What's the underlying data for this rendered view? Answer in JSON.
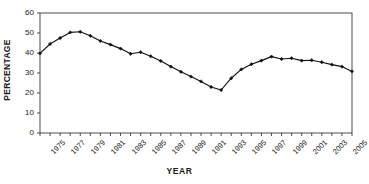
{
  "chart_data": {
    "type": "line",
    "title": "",
    "xlabel": "YEAR",
    "ylabel": "PERCENTAGE",
    "xlim": [
      1975,
      2006
    ],
    "ylim": [
      0,
      60
    ],
    "ytick_values": [
      0,
      10,
      20,
      30,
      40,
      50,
      60
    ],
    "ytick_labels": [
      "0",
      "10",
      "20",
      "30",
      "40",
      "50",
      "60"
    ],
    "xtick_labels": [
      "1975",
      "1977",
      "1979",
      "1981",
      "1983",
      "1985",
      "1987",
      "1989",
      "1991",
      "1993",
      "1995",
      "1997",
      "1999",
      "2001",
      "2003",
      "2005"
    ],
    "grid": false,
    "legend": false,
    "line_color": "#111111",
    "marker": "diamond",
    "marker_color": "#111111",
    "x": [
      1975,
      1976,
      1977,
      1978,
      1979,
      1980,
      1981,
      1982,
      1983,
      1984,
      1985,
      1986,
      1987,
      1988,
      1989,
      1990,
      1991,
      1992,
      1993,
      1994,
      1995,
      1996,
      1997,
      1998,
      1999,
      2000,
      2001,
      2002,
      2003,
      2004,
      2005,
      2006
    ],
    "values": [
      39.8,
      44.5,
      47.5,
      50.3,
      50.6,
      48.6,
      46.0,
      44.2,
      42.2,
      39.6,
      40.4,
      38.4,
      36.0,
      33.2,
      30.6,
      28.2,
      25.8,
      23.0,
      21.5,
      27.4,
      31.8,
      34.4,
      36.2,
      38.2,
      37.0,
      37.4,
      36.2,
      36.4,
      35.4,
      34.2,
      33.2,
      30.8
    ]
  }
}
